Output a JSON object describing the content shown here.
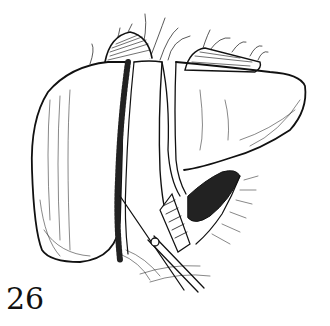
{
  "figure": {
    "number": "26",
    "style": "black ink line drawing with hatching",
    "colors": {
      "ink": "#111111",
      "background": "#ffffff"
    },
    "elements": [
      "liver-right-lobe",
      "liver-left-lobe",
      "parenchymal-transection-line",
      "falciform-ligament",
      "gallbladder-fundus",
      "diaphragm-attachments",
      "hilar-vessels",
      "surgical-clamp-instrument"
    ]
  }
}
